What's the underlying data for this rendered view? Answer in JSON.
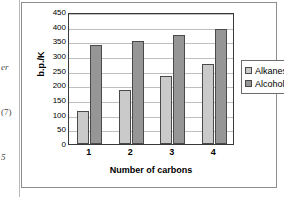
{
  "page_margin": {
    "line1": "er",
    "line2": "(7)",
    "line3": "5"
  },
  "chart_data": {
    "type": "bar",
    "title": "",
    "categories": [
      "1",
      "2",
      "3",
      "4"
    ],
    "series": [
      {
        "name": "Alkanes",
        "values": [
          112,
          185,
          231,
          273
        ]
      },
      {
        "name": "Alcohols",
        "values": [
          338,
          351,
          371,
          391
        ]
      }
    ],
    "xlabel": "Number of carbons",
    "ylabel": "b.p./K",
    "ylim": [
      0,
      450
    ],
    "ytick_step": 50,
    "yticks": [
      "450",
      "400",
      "350",
      "300",
      "250",
      "200",
      "150",
      "100",
      "50",
      "0"
    ],
    "grid": true,
    "legend_position": "right",
    "colors": {
      "alkanes": "#cacaca",
      "alcohols": "#969696",
      "bar_border": "#4a4a4a",
      "gridline": "#bfbfbf",
      "axis": "#3a3a3a"
    }
  }
}
